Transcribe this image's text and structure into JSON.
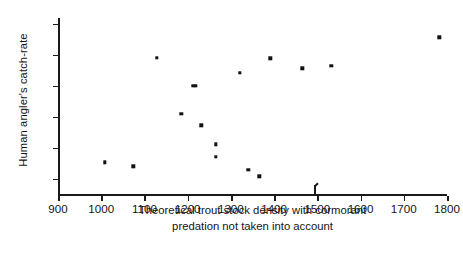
{
  "chart_data": {
    "type": "scatter",
    "title": "",
    "xlabel": "Theoretical trout stock density with cormorant predation not taken into account",
    "xlabel_lines": [
      "Theoretical trout stock density with cormorant",
      "predation not taken into account"
    ],
    "ylabel": "Human angler's catch-rate",
    "xlim": [
      900,
      1800
    ],
    "ylim": [
      0,
      1
    ],
    "grid": false,
    "legend": null,
    "xticks": [
      900,
      1000,
      1100,
      1200,
      1300,
      1400,
      1500,
      1600,
      1700,
      1800
    ],
    "xticklabels": [
      "900",
      "1000",
      "1100",
      "1200",
      "1300",
      "1400",
      "1500",
      "1600",
      "1700",
      "1800"
    ],
    "yticks": [
      0.09,
      0.27,
      0.45,
      0.63,
      0.81,
      0.99
    ],
    "yticklabels": [
      "",
      "",
      "",
      "",
      "",
      ""
    ],
    "annotations": [
      {
        "name": "x-axis-arrow-marker",
        "x": 1495,
        "y": 0,
        "text": ""
      }
    ],
    "series": [
      {
        "name": "observations",
        "marker": "square",
        "color": "#111111",
        "points": [
          {
            "x": 1008,
            "y": 0.185
          },
          {
            "x": 1074,
            "y": 0.162
          },
          {
            "x": 1128,
            "y": 0.792
          },
          {
            "x": 1185,
            "y": 0.468
          },
          {
            "x": 1213,
            "y": 0.628
          },
          {
            "x": 1219,
            "y": 0.628
          },
          {
            "x": 1232,
            "y": 0.4
          },
          {
            "x": 1265,
            "y": 0.288
          },
          {
            "x": 1265,
            "y": 0.218
          },
          {
            "x": 1320,
            "y": 0.705
          },
          {
            "x": 1340,
            "y": 0.14
          },
          {
            "x": 1366,
            "y": 0.104
          },
          {
            "x": 1391,
            "y": 0.79
          },
          {
            "x": 1465,
            "y": 0.73
          },
          {
            "x": 1532,
            "y": 0.745
          },
          {
            "x": 1782,
            "y": 0.91
          }
        ]
      }
    ]
  }
}
